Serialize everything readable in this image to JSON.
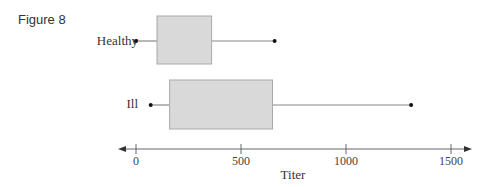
{
  "figure_label": "Figure 8",
  "chart_data": {
    "type": "boxplot",
    "title": "",
    "xlabel": "Titer",
    "ylabel": "",
    "xlim": [
      0,
      1500
    ],
    "xticks": [
      0,
      500,
      1000,
      1500
    ],
    "xtick_labels": [
      "0",
      "500",
      "1000",
      "1500"
    ],
    "grid": false,
    "legend": null,
    "series": [
      {
        "name": "Healthy",
        "min": 0,
        "q1": 100,
        "q3": 360,
        "max": 660
      },
      {
        "name": "Ill",
        "min": 70,
        "q1": 160,
        "q3": 650,
        "max": 1310
      }
    ]
  },
  "colors": {
    "box_fill": "#d9d9d9",
    "box_stroke": "#aaaaaa",
    "whisker": "#888888",
    "dot": "#111111",
    "axis": "#666666"
  }
}
